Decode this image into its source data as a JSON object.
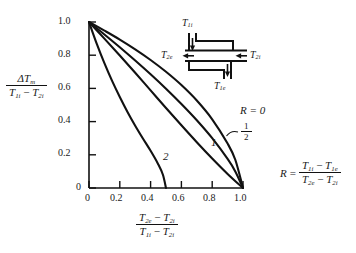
{
  "chart_data": {
    "type": "line",
    "title": "",
    "xlabel": "(T2e - T2i) / (T1i - T2i)",
    "ylabel": "dTm / (T1i - T2i)",
    "xlim": [
      0,
      1.0
    ],
    "ylim": [
      0,
      1.0
    ],
    "xticks": [
      "0",
      "0.2",
      "0.4",
      "0.6",
      "0.8",
      "1.0"
    ],
    "yticks": [
      "0",
      "0.2",
      "0.4",
      "0.6",
      "0.8",
      "1.0"
    ],
    "grid": false,
    "legend_position": "inline-curve-labels",
    "series": [
      {
        "name": "R = 0",
        "label": "R = 0",
        "points": [
          [
            0,
            1.0
          ],
          [
            0.1,
            0.948
          ],
          [
            0.2,
            0.894
          ],
          [
            0.3,
            0.835
          ],
          [
            0.4,
            0.771
          ],
          [
            0.5,
            0.7
          ],
          [
            0.6,
            0.62
          ],
          [
            0.7,
            0.527
          ],
          [
            0.8,
            0.414
          ],
          [
            0.9,
            0.268
          ],
          [
            0.95,
            0.17
          ],
          [
            1.0,
            0
          ]
        ]
      },
      {
        "name": "R = 1/2",
        "label": "1/2",
        "points": [
          [
            0,
            1.0
          ],
          [
            0.1,
            0.925
          ],
          [
            0.2,
            0.848
          ],
          [
            0.3,
            0.768
          ],
          [
            0.4,
            0.685
          ],
          [
            0.5,
            0.598
          ],
          [
            0.6,
            0.506
          ],
          [
            0.7,
            0.408
          ],
          [
            0.8,
            0.3
          ],
          [
            0.9,
            0.175
          ],
          [
            0.95,
            0.1
          ],
          [
            1.0,
            0
          ]
        ]
      },
      {
        "name": "R = 1",
        "label": "1",
        "points": [
          [
            0,
            1.0
          ],
          [
            0.1,
            0.9
          ],
          [
            0.2,
            0.798
          ],
          [
            0.3,
            0.694
          ],
          [
            0.4,
            0.588
          ],
          [
            0.5,
            0.482
          ],
          [
            0.6,
            0.378
          ],
          [
            0.7,
            0.276
          ],
          [
            0.8,
            0.178
          ],
          [
            0.9,
            0.085
          ],
          [
            1.0,
            0
          ]
        ]
      },
      {
        "name": "R = 2",
        "label": "2",
        "points": [
          [
            0,
            1.0
          ],
          [
            0.05,
            0.87
          ],
          [
            0.1,
            0.752
          ],
          [
            0.15,
            0.645
          ],
          [
            0.2,
            0.548
          ],
          [
            0.25,
            0.458
          ],
          [
            0.3,
            0.375
          ],
          [
            0.35,
            0.298
          ],
          [
            0.4,
            0.224
          ],
          [
            0.45,
            0.142
          ],
          [
            0.48,
            0.08
          ],
          [
            0.5,
            0
          ]
        ]
      }
    ],
    "annotations": [
      {
        "name": "r-equals-zero",
        "text": "R = 0"
      },
      {
        "name": "r-one-half",
        "text": "1/2"
      },
      {
        "name": "r-one",
        "text": "1"
      },
      {
        "name": "r-two",
        "text": "2"
      }
    ]
  },
  "axis": {
    "x_title": {
      "num_t1": "T",
      "num_s1": "2e",
      "num_minus": "−",
      "num_t2": "T",
      "num_s2": "2i",
      "den_t1": "T",
      "den_s1": "1i",
      "den_minus": "−",
      "den_t2": "T",
      "den_s2": "2i"
    },
    "y_title": {
      "num_delta": "ΔT",
      "num_sub": "m",
      "den_t1": "T",
      "den_s1": "1i",
      "den_minus": "−",
      "den_t2": "T",
      "den_s2": "2i"
    },
    "x_tick_labels": [
      "0",
      "0.2",
      "0.4",
      "0.6",
      "0.8",
      "1.0"
    ],
    "y_tick_labels": [
      "0",
      "0.2",
      "0.4",
      "0.6",
      "0.8",
      "1.0"
    ]
  },
  "r_definition": {
    "lhs": "R",
    "equals": "=",
    "num_t1": "T",
    "num_s1": "1i",
    "num_minus": "−",
    "num_t2": "T",
    "num_s2": "1e",
    "den_t1": "T",
    "den_s1": "2e",
    "den_minus": "−",
    "den_t2": "T",
    "den_s2": "2i"
  },
  "curve_labels": {
    "r_zero": "R = 0",
    "r_half_num": "1",
    "r_half_den": "2",
    "r_one": "1",
    "r_two": "2"
  },
  "schematic": {
    "title": "heat-exchanger-inset",
    "inlet_top": {
      "t": "T",
      "sub": "1i"
    },
    "inlet_right": {
      "t": "T",
      "sub": "2i"
    },
    "outlet_left": {
      "t": "T",
      "sub": "2e"
    },
    "outlet_bottom": {
      "t": "T",
      "sub": "1e"
    }
  }
}
